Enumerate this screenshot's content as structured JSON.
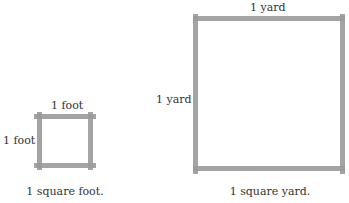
{
  "small_square": {
    "top_label": "1 foot",
    "side_label": "1 foot",
    "caption": "1 square foot."
  },
  "large_square": {
    "top_label": "1 yard",
    "side_label": "1 yard",
    "caption": "1 square yard."
  },
  "colors": {
    "line": "#9a9a9a",
    "text": "#333333",
    "background": "#ffffff"
  }
}
